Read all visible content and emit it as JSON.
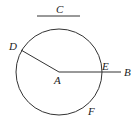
{
  "diagram": {
    "type": "geometry",
    "colors": {
      "stroke": "#333333",
      "label": "#222222",
      "background": "#ffffff"
    },
    "segment_c": {
      "label": "C",
      "x1": 37,
      "y1": 16,
      "x2": 80,
      "y2": 16
    },
    "circle": {
      "center_label": "A",
      "cx": 59,
      "cy": 72,
      "r": 43
    },
    "points": {
      "A": {
        "label": "A",
        "x": 59,
        "y": 72
      },
      "B": {
        "label": "B",
        "x": 121,
        "y": 72
      },
      "D": {
        "label": "D",
        "x": 21,
        "y": 50
      },
      "E": {
        "label": "E",
        "x": 102,
        "y": 72
      },
      "F": {
        "label": "F",
        "x": 90,
        "y": 105
      }
    },
    "segments": [
      {
        "name": "AD",
        "from": "A",
        "to": "D"
      },
      {
        "name": "AB",
        "from": "A",
        "to": "B"
      }
    ]
  }
}
